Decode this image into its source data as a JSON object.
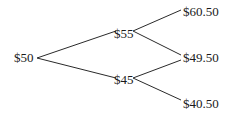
{
  "diagram": {
    "type": "binomial-tree",
    "line_color": "#2a2a2a",
    "text_color": "#1a1a1a",
    "nodes": {
      "root": {
        "label": "$50",
        "x": 14,
        "y": 51
      },
      "up": {
        "label": "$55",
        "x": 113,
        "y": 27
      },
      "down": {
        "label": "$45",
        "x": 113,
        "y": 73
      },
      "up_up": {
        "label": "$60.50",
        "x": 183,
        "y": 5
      },
      "up_down": {
        "label": "$49.50",
        "x": 183,
        "y": 51
      },
      "down_down": {
        "label": "$40.50",
        "x": 183,
        "y": 97
      }
    },
    "edges": [
      {
        "from": "root",
        "to": "up"
      },
      {
        "from": "root",
        "to": "down"
      },
      {
        "from": "up",
        "to": "up_up"
      },
      {
        "from": "up",
        "to": "up_down"
      },
      {
        "from": "down",
        "to": "up_down"
      },
      {
        "from": "down",
        "to": "down_down"
      }
    ]
  }
}
